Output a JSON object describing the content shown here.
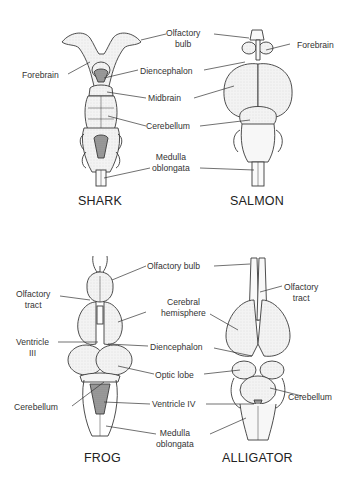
{
  "diagram": {
    "colors": {
      "background": "#ffffff",
      "line": "#3a3a3a",
      "fill": "#f2f2f2",
      "shade": "#9a9a9a",
      "text": "#333333"
    },
    "panels": [
      {
        "id": "shark",
        "title": "SHARK",
        "labels": {
          "olfactory_bulb": [
            "Olfactory",
            "bulb"
          ],
          "forebrain": "Forebrain",
          "diencephalon": "Diencephalon",
          "midbrain": "Midbrain",
          "cerebellum": "Cerebellum",
          "medulla_oblongata": [
            "Medulla",
            "oblongata"
          ]
        }
      },
      {
        "id": "salmon",
        "title": "SALMON",
        "labels": {
          "forebrain": "Forebrain"
        }
      },
      {
        "id": "frog",
        "title": "FROG",
        "labels": {
          "olfactory_tract": [
            "Olfactory",
            "tract"
          ],
          "ventricle_iii": [
            "Ventricle",
            "III"
          ],
          "cerebellum": "Cerebellum",
          "olfactory_bulb": "Olfactory bulb",
          "cerebral_hemisphere": [
            "Cerebral",
            "hemisphere"
          ],
          "diencephalon": "Diencephalon",
          "optic_lobe": "Optic lobe",
          "ventricle_iv": "Ventricle IV",
          "medulla_oblongata": [
            "Medulla",
            "oblongata"
          ]
        }
      },
      {
        "id": "alligator",
        "title": "ALLIGATOR",
        "labels": {
          "olfactory_tract": [
            "Olfactory",
            "tract"
          ],
          "cerebellum": "Cerebellum"
        }
      }
    ]
  }
}
